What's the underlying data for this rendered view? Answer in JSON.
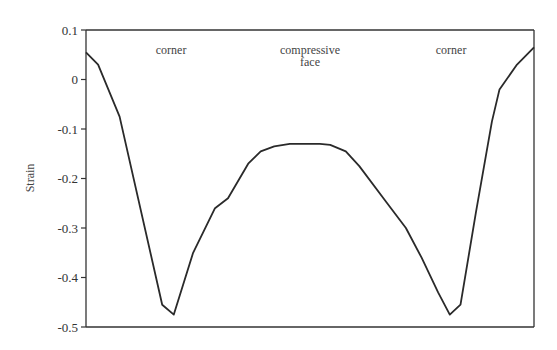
{
  "chart_data": {
    "type": "line",
    "title": "",
    "xlabel": "",
    "ylabel": "Strain",
    "ylim": [
      -0.5,
      0.1
    ],
    "yticks": [
      0.1,
      0,
      -0.1,
      -0.2,
      -0.3,
      -0.4,
      -0.5
    ],
    "ytick_labels": [
      "0.1",
      "0",
      "-0.1",
      "-0.2",
      "-0.3",
      "-0.4",
      "-0.5"
    ],
    "xlim": [
      0,
      1
    ],
    "grid": false,
    "legend": null,
    "annotations": [
      {
        "text": "corner",
        "x": 0.19,
        "y": 0.06
      },
      {
        "text": "compressive",
        "x": 0.5,
        "y": 0.06
      },
      {
        "text": "face",
        "x": 0.5,
        "y": 0.035
      },
      {
        "text": "corner",
        "x": 0.815,
        "y": 0.06
      }
    ],
    "series": [
      {
        "name": "strain",
        "x": [
          0.0,
          0.027,
          0.075,
          0.17,
          0.196,
          0.239,
          0.288,
          0.317,
          0.362,
          0.39,
          0.42,
          0.455,
          0.5,
          0.522,
          0.545,
          0.58,
          0.61,
          0.668,
          0.714,
          0.749,
          0.786,
          0.812,
          0.836,
          0.87,
          0.906,
          0.923,
          0.962,
          1.0
        ],
        "y": [
          0.055,
          0.03,
          -0.075,
          -0.455,
          -0.475,
          -0.35,
          -0.26,
          -0.24,
          -0.17,
          -0.145,
          -0.135,
          -0.13,
          -0.13,
          -0.13,
          -0.132,
          -0.145,
          -0.175,
          -0.245,
          -0.3,
          -0.36,
          -0.43,
          -0.475,
          -0.455,
          -0.27,
          -0.085,
          -0.02,
          0.03,
          0.065
        ]
      }
    ]
  }
}
